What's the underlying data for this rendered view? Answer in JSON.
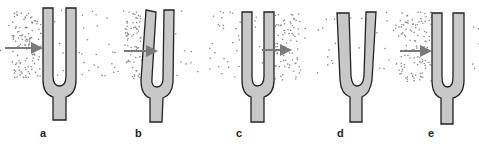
{
  "figure": {
    "colors": {
      "fork_fill": "#c8c8c8",
      "fork_stroke": "#222222",
      "arrow": "#7a7a7a",
      "particle": "#8a8a8a",
      "background": "#ffffff"
    },
    "panels": [
      {
        "label": "a",
        "state": "rest, compression on left",
        "arrow_direction": "right"
      },
      {
        "label": "b",
        "state": "tines bent right, compression left of fork",
        "arrow_direction": "right"
      },
      {
        "label": "c",
        "state": "rest, compression on right",
        "arrow_direction": "right"
      },
      {
        "label": "d",
        "state": "tines spread outward, rarefaction",
        "arrow_direction": "none"
      },
      {
        "label": "e",
        "state": "rest, compression on left",
        "arrow_direction": "right"
      }
    ]
  }
}
